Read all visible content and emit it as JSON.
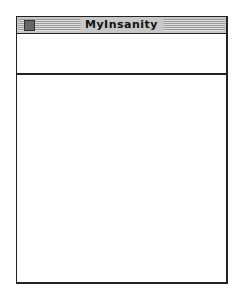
{
  "window": {
    "title": "MyInsanity",
    "close_box_icon": "close-box-icon",
    "header_pane_text": "",
    "content_pane_text": ""
  },
  "colors": {
    "border": "#222222",
    "titlebar": "#c8c8c8",
    "background": "#ffffff"
  }
}
